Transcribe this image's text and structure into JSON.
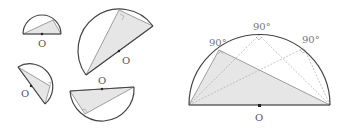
{
  "figure": {
    "center_label": "O",
    "angle_label": "90°",
    "left_group": {
      "figures": [
        {
          "id": "semicircle-top-left",
          "label": "O"
        },
        {
          "id": "semicircle-large-rotated",
          "label": "O"
        },
        {
          "id": "semicircle-bottom-left",
          "label": "O"
        },
        {
          "id": "semicircle-bottom-middle",
          "label": "O"
        }
      ]
    },
    "right_group": {
      "labels": [
        "90°",
        "90°",
        "90°"
      ],
      "center_label": "O"
    }
  }
}
